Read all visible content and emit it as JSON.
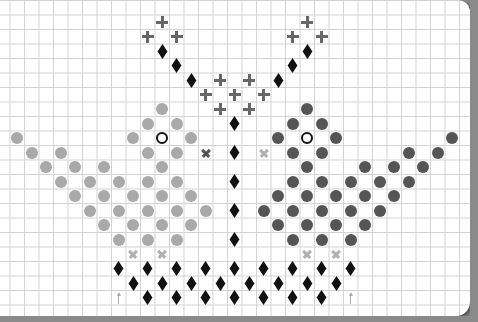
{
  "grid": {
    "origin_x": 2.5,
    "origin_y": 7.5,
    "pitch": 14.5
  },
  "colors": {
    "light_bird": "#a9a9a9",
    "dark_bird": "#555555",
    "diamond": "#111111",
    "plus": "#666666",
    "cross_dark": "#555555",
    "cross_light": "#b0b0b0",
    "arrow": "#aaaaaa"
  },
  "legend": {
    "circle_light": "light grey stitch",
    "circle_dark": "dark grey stitch",
    "ring": "eye",
    "diamond": "black stitch",
    "plus": "grey plus stitch",
    "cross": "x stitch",
    "arrow": "center marker"
  },
  "symbols": {
    "plus": [
      [
        11,
        1
      ],
      [
        21,
        1
      ],
      [
        10,
        2
      ],
      [
        12,
        2
      ],
      [
        20,
        2
      ],
      [
        22,
        2
      ],
      [
        15,
        5
      ],
      [
        17,
        5
      ],
      [
        14,
        6
      ],
      [
        16,
        6
      ],
      [
        18,
        6
      ],
      [
        15,
        7
      ],
      [
        17,
        7
      ]
    ],
    "diamond": [
      [
        11,
        3
      ],
      [
        21,
        3
      ],
      [
        12,
        4
      ],
      [
        20,
        4
      ],
      [
        13,
        5
      ],
      [
        19,
        5
      ],
      [
        16,
        8
      ],
      [
        16,
        10
      ],
      [
        16,
        12
      ],
      [
        16,
        14
      ],
      [
        16,
        16
      ],
      [
        8,
        18
      ],
      [
        10,
        18
      ],
      [
        12,
        18
      ],
      [
        14,
        18
      ],
      [
        16,
        18
      ],
      [
        18,
        18
      ],
      [
        20,
        18
      ],
      [
        22,
        18
      ],
      [
        24,
        18
      ],
      [
        9,
        19
      ],
      [
        11,
        19
      ],
      [
        13,
        19
      ],
      [
        15,
        19
      ],
      [
        17,
        19
      ],
      [
        19,
        19
      ],
      [
        21,
        19
      ],
      [
        23,
        19
      ],
      [
        10,
        20
      ],
      [
        12,
        20
      ],
      [
        14,
        20
      ],
      [
        16,
        20
      ],
      [
        18,
        20
      ],
      [
        20,
        20
      ],
      [
        22,
        20
      ]
    ],
    "circle_light": [
      [
        11,
        7
      ],
      [
        10,
        8
      ],
      [
        12,
        8
      ],
      [
        1,
        9
      ],
      [
        9,
        9
      ],
      [
        13,
        9
      ],
      [
        2,
        10
      ],
      [
        4,
        10
      ],
      [
        10,
        10
      ],
      [
        12,
        10
      ],
      [
        3,
        11
      ],
      [
        5,
        11
      ],
      [
        7,
        11
      ],
      [
        11,
        11
      ],
      [
        4,
        12
      ],
      [
        6,
        12
      ],
      [
        8,
        12
      ],
      [
        10,
        12
      ],
      [
        12,
        12
      ],
      [
        5,
        13
      ],
      [
        7,
        13
      ],
      [
        9,
        13
      ],
      [
        11,
        13
      ],
      [
        13,
        13
      ],
      [
        6,
        14
      ],
      [
        8,
        14
      ],
      [
        10,
        14
      ],
      [
        12,
        14
      ],
      [
        14,
        14
      ],
      [
        7,
        15
      ],
      [
        9,
        15
      ],
      [
        11,
        15
      ],
      [
        13,
        15
      ],
      [
        8,
        16
      ],
      [
        10,
        16
      ],
      [
        12,
        16
      ]
    ],
    "circle_dark": [
      [
        21,
        7
      ],
      [
        20,
        8
      ],
      [
        22,
        8
      ],
      [
        31,
        9
      ],
      [
        19,
        9
      ],
      [
        23,
        9
      ],
      [
        30,
        10
      ],
      [
        28,
        10
      ],
      [
        22,
        10
      ],
      [
        20,
        10
      ],
      [
        29,
        11
      ],
      [
        27,
        11
      ],
      [
        25,
        11
      ],
      [
        21,
        11
      ],
      [
        28,
        12
      ],
      [
        26,
        12
      ],
      [
        24,
        12
      ],
      [
        22,
        12
      ],
      [
        20,
        12
      ],
      [
        27,
        13
      ],
      [
        25,
        13
      ],
      [
        23,
        13
      ],
      [
        21,
        13
      ],
      [
        19,
        13
      ],
      [
        26,
        14
      ],
      [
        24,
        14
      ],
      [
        22,
        14
      ],
      [
        20,
        14
      ],
      [
        18,
        14
      ],
      [
        25,
        15
      ],
      [
        23,
        15
      ],
      [
        21,
        15
      ],
      [
        19,
        15
      ],
      [
        24,
        16
      ],
      [
        22,
        16
      ],
      [
        20,
        16
      ]
    ],
    "ring": [
      [
        11,
        9
      ],
      [
        21,
        9
      ]
    ],
    "cross_dark": [
      [
        14,
        10
      ]
    ],
    "cross_light": [
      [
        18,
        10
      ],
      [
        9,
        17
      ],
      [
        11,
        17
      ],
      [
        21,
        17
      ],
      [
        23,
        17
      ]
    ],
    "arrow": [
      [
        8,
        20
      ],
      [
        24,
        20
      ]
    ]
  }
}
